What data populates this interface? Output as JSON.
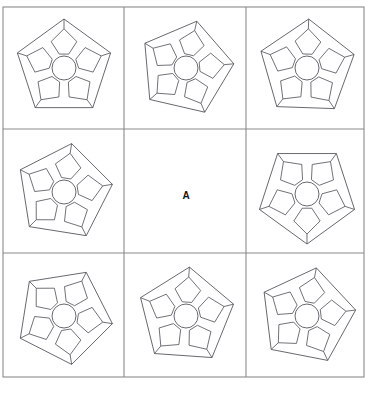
{
  "puzzle": {
    "type": "matrix-reasoning",
    "rows": 3,
    "columns": 3,
    "answer_label": "A",
    "frame": {
      "x": 3,
      "y": 7,
      "width": 361,
      "height": 370
    },
    "grid_lines": {
      "vertical": [
        124,
        246
      ],
      "horizontal": [
        129,
        253
      ]
    },
    "colors": {
      "background": "#ffffff",
      "grid_stroke": "#8a8a8a",
      "figure_stroke": "#4d4d55",
      "letter": "#141414"
    },
    "figure_description": "regular pentagon outline enclosing a central circle with five quadrilateral petals radiating toward the pentagon vertices",
    "cells": [
      {
        "id": "cell-r1c1",
        "row": 1,
        "column": 1,
        "position": "top-left",
        "content": "pentagon-flower",
        "center_x": 64,
        "center_y": 68,
        "radius": 49,
        "rotation": 0,
        "hub_radius": 12,
        "petals": 5,
        "empty": false
      },
      {
        "id": "cell-r1c2",
        "row": 1,
        "column": 2,
        "position": "top-center",
        "content": "pentagon-flower",
        "center_x": 186,
        "center_y": 68,
        "radius": 48,
        "rotation": 13,
        "hub_radius": 12,
        "petals": 5,
        "empty": false
      },
      {
        "id": "cell-r1c3",
        "row": 1,
        "column": 3,
        "position": "top-right",
        "content": "pentagon-flower",
        "center_x": 307,
        "center_y": 68,
        "radius": 49,
        "rotation": 2,
        "hub_radius": 12,
        "petals": 5,
        "empty": false
      },
      {
        "id": "cell-r2c1",
        "row": 2,
        "column": 1,
        "position": "middle-left",
        "content": "pentagon-flower",
        "center_x": 64,
        "center_y": 192,
        "radius": 49,
        "rotation": 9,
        "hub_radius": 12,
        "petals": 5,
        "empty": false
      },
      {
        "id": "cell-r2c2",
        "row": 2,
        "column": 2,
        "position": "middle-center",
        "content": "answer-letter",
        "center_x": 186,
        "center_y": 196,
        "radius": 0,
        "rotation": 0,
        "hub_radius": 0,
        "petals": 0,
        "empty": true
      },
      {
        "id": "cell-r2c3",
        "row": 2,
        "column": 3,
        "position": "middle-right",
        "content": "pentagon-flower",
        "center_x": 307,
        "center_y": 194,
        "radius": 50,
        "rotation": 36,
        "hub_radius": 12,
        "petals": 5,
        "empty": false
      },
      {
        "id": "cell-r3c1",
        "row": 3,
        "column": 1,
        "position": "bottom-left",
        "content": "pentagon-flower",
        "center_x": 64,
        "center_y": 316,
        "radius": 49,
        "rotation": 27,
        "hub_radius": 12,
        "petals": 5,
        "empty": false
      },
      {
        "id": "cell-r3c2",
        "row": 3,
        "column": 2,
        "position": "bottom-center",
        "content": "pentagon-flower",
        "center_x": 186,
        "center_y": 316,
        "radius": 49,
        "rotation": 4,
        "hub_radius": 12,
        "petals": 5,
        "empty": false
      },
      {
        "id": "cell-r3c3",
        "row": 3,
        "column": 3,
        "position": "bottom-right",
        "content": "pentagon-flower",
        "center_x": 307,
        "center_y": 316,
        "radius": 49,
        "rotation": 11,
        "hub_radius": 12,
        "petals": 5,
        "empty": false
      }
    ]
  }
}
